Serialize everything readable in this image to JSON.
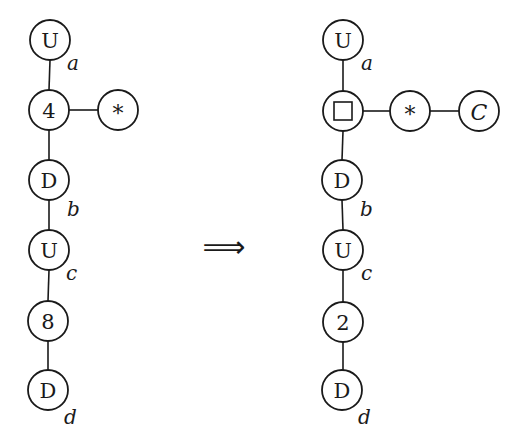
{
  "diagram": {
    "left_graph": {
      "nodes": [
        {
          "id": "L1",
          "label": "U",
          "subscript": "a"
        },
        {
          "id": "L2",
          "label": "4",
          "subscript": ""
        },
        {
          "id": "L3",
          "label": "D",
          "subscript": "b"
        },
        {
          "id": "L4",
          "label": "U",
          "subscript": "c"
        },
        {
          "id": "L5",
          "label": "8",
          "subscript": ""
        },
        {
          "id": "L6",
          "label": "D",
          "subscript": "d"
        },
        {
          "id": "L7",
          "label": "*",
          "subscript": ""
        }
      ],
      "edges": [
        [
          "L1",
          "L2"
        ],
        [
          "L2",
          "L3"
        ],
        [
          "L3",
          "L4"
        ],
        [
          "L4",
          "L5"
        ],
        [
          "L5",
          "L6"
        ],
        [
          "L2",
          "L7"
        ]
      ]
    },
    "arrow": {
      "symbol": "⟹"
    },
    "right_graph": {
      "nodes": [
        {
          "id": "R1",
          "label": "U",
          "subscript": "a"
        },
        {
          "id": "R2",
          "label": "□",
          "subscript": ""
        },
        {
          "id": "R3",
          "label": "D",
          "subscript": "b"
        },
        {
          "id": "R4",
          "label": "U",
          "subscript": "c"
        },
        {
          "id": "R5",
          "label": "2",
          "subscript": ""
        },
        {
          "id": "R6",
          "label": "D",
          "subscript": "d"
        },
        {
          "id": "R7",
          "label": "*",
          "subscript": ""
        },
        {
          "id": "R8",
          "label": "C",
          "subscript": ""
        }
      ],
      "edges": [
        [
          "R1",
          "R2"
        ],
        [
          "R2",
          "R3"
        ],
        [
          "R3",
          "R4"
        ],
        [
          "R4",
          "R5"
        ],
        [
          "R5",
          "R6"
        ],
        [
          "R2",
          "R7"
        ],
        [
          "R7",
          "R8"
        ]
      ]
    }
  }
}
